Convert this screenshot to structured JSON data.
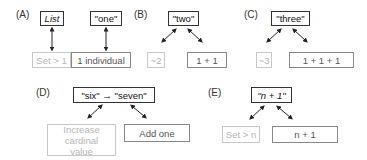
{
  "panels": {
    "A": {
      "label": "(A)",
      "top_left": "List",
      "top_right": "\"one\"",
      "bottom_left": "Set > 1",
      "bottom_right": "1 individual"
    },
    "B": {
      "label": "(B)",
      "top": "\"two\"",
      "bottom_left": "~2",
      "bottom_right": "1 + 1"
    },
    "C": {
      "label": "(C)",
      "top": "\"three\"",
      "bottom_left": "~3",
      "bottom_right": "1 + 1 + 1"
    },
    "D": {
      "label": "(D)",
      "top": "\"six\" → \"seven\"",
      "bottom_left": "Increase cardinal value",
      "bottom_right": "Add one"
    },
    "E": {
      "label": "(E)",
      "top": "\"n + 1\"",
      "bottom_left": "Set > n",
      "bottom_right": "n + 1"
    }
  },
  "colors": {
    "primary_border": "#333333",
    "faint_text": "#b5b5b5"
  }
}
